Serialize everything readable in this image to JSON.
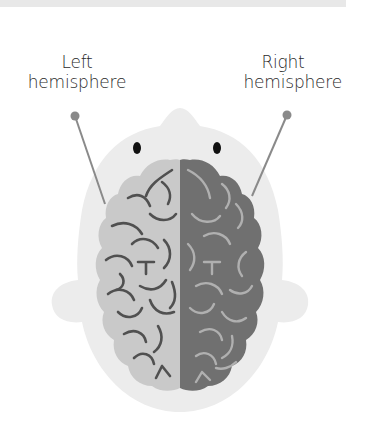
{
  "diagram": {
    "labels": {
      "left": {
        "line1": "Left",
        "line2": "hemisphere"
      },
      "right": {
        "line1": "Right",
        "line2": "hemisphere"
      }
    },
    "colors": {
      "top_bar": "#e8e8e8",
      "head_fill": "#ececec",
      "left_hemisphere_fill": "#c9c9c9",
      "left_hemisphere_folds": "#505050",
      "right_hemisphere_fill": "#707070",
      "right_hemisphere_folds": "#b0b0b0",
      "pointer": "#8a8a8a",
      "eyes": "#111111",
      "text": "#2a2a2a"
    }
  }
}
